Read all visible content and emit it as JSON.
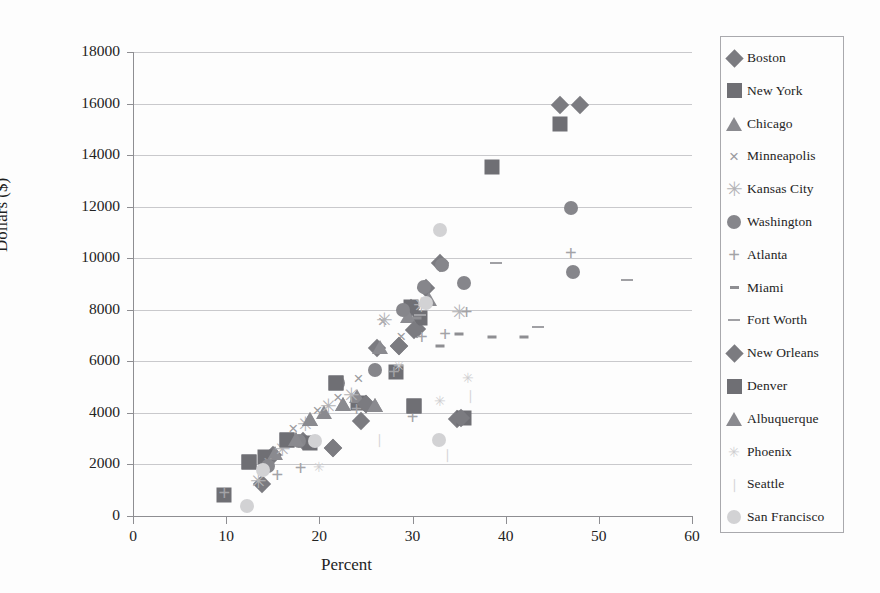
{
  "chart_data": {
    "type": "scatter",
    "title": "",
    "xlabel": "Percent",
    "ylabel": "Dollars ($)",
    "xlim": [
      0,
      60
    ],
    "ylim": [
      0,
      18000
    ],
    "xticks": [
      "0",
      "10",
      "20",
      "30",
      "40",
      "50",
      "60"
    ],
    "yticks": [
      "0",
      "2000",
      "4000",
      "6000",
      "8000",
      "10000",
      "12000",
      "14000",
      "16000",
      "18000"
    ],
    "grid": "horizontal",
    "legend_position": "right-outside",
    "series": [
      {
        "name": "Boston",
        "marker": "diamond",
        "color": "#7b7b80",
        "points": [
          [
            45.8,
            15950
          ],
          [
            48.0,
            15950
          ],
          [
            33.0,
            9800
          ],
          [
            31.5,
            8850
          ],
          [
            29.8,
            8050
          ],
          [
            30.5,
            7250
          ],
          [
            28.5,
            6600
          ],
          [
            26.2,
            6500
          ],
          [
            25.0,
            4350
          ],
          [
            24.5,
            3700
          ],
          [
            21.5,
            2650
          ],
          [
            18.2,
            2900
          ],
          [
            15.0,
            2350
          ],
          [
            13.8,
            1250
          ],
          [
            34.8,
            3750
          ]
        ]
      },
      {
        "name": "New York",
        "marker": "square",
        "color": "#6f6f74",
        "points": [
          [
            45.8,
            15200
          ],
          [
            38.5,
            13550
          ],
          [
            29.8,
            8100
          ],
          [
            30.8,
            7700
          ],
          [
            28.2,
            5600
          ],
          [
            21.8,
            5150
          ],
          [
            24.2,
            4400
          ],
          [
            19.0,
            2850
          ],
          [
            16.5,
            2950
          ],
          [
            14.2,
            2300
          ],
          [
            12.5,
            2100
          ],
          [
            9.8,
            800
          ],
          [
            30.2,
            4280
          ],
          [
            35.5,
            3800
          ]
        ]
      },
      {
        "name": "Chicago",
        "marker": "triangle",
        "color": "#8a8a8f",
        "points": [
          [
            31.8,
            8400
          ],
          [
            29.5,
            7750
          ],
          [
            26.5,
            6550
          ],
          [
            24.0,
            4650
          ],
          [
            22.5,
            4350
          ],
          [
            20.5,
            4050
          ],
          [
            19.0,
            3750
          ],
          [
            17.5,
            3000
          ],
          [
            15.2,
            2450
          ],
          [
            26.0,
            4300
          ]
        ]
      },
      {
        "name": "Minneapolis",
        "marker": "x",
        "color": "#9b9b9f",
        "points": [
          [
            29.0,
            7950
          ],
          [
            26.8,
            7550
          ],
          [
            24.2,
            5350
          ],
          [
            22.0,
            4600
          ],
          [
            19.8,
            4100
          ],
          [
            17.2,
            3400
          ],
          [
            14.5,
            2150
          ],
          [
            28.8,
            7000
          ]
        ]
      },
      {
        "name": "Kansas City",
        "marker": "star",
        "color": "#b4b4b7",
        "points": [
          [
            35.0,
            7900
          ],
          [
            31.0,
            8200
          ],
          [
            27.0,
            7600
          ],
          [
            23.5,
            4700
          ],
          [
            21.0,
            4250
          ],
          [
            18.5,
            3550
          ],
          [
            16.0,
            2600
          ],
          [
            13.5,
            1350
          ]
        ]
      },
      {
        "name": "Washington",
        "marker": "circle",
        "color": "#86868b",
        "points": [
          [
            47.0,
            11950
          ],
          [
            47.2,
            9450
          ],
          [
            33.2,
            9750
          ],
          [
            31.2,
            8900
          ],
          [
            35.5,
            9050
          ],
          [
            29.0,
            8000
          ],
          [
            22.0,
            5150
          ],
          [
            26.0,
            5650
          ],
          [
            17.8,
            2900
          ],
          [
            14.5,
            1950
          ]
        ]
      },
      {
        "name": "Atlanta",
        "marker": "plus",
        "color": "#a3a3a7",
        "points": [
          [
            47.0,
            10200
          ],
          [
            35.8,
            7900
          ],
          [
            33.5,
            7050
          ],
          [
            31.0,
            6950
          ],
          [
            28.0,
            5600
          ],
          [
            24.0,
            4150
          ],
          [
            18.0,
            1850
          ],
          [
            15.5,
            1600
          ],
          [
            9.8,
            900
          ],
          [
            30.0,
            3850
          ]
        ]
      },
      {
        "name": "Miami",
        "marker": "dash",
        "color": "#8e8e92",
        "points": [
          [
            42.0,
            6950
          ],
          [
            38.5,
            6950
          ],
          [
            35.0,
            7050
          ],
          [
            33.0,
            6600
          ],
          [
            30.5,
            7700
          ]
        ]
      },
      {
        "name": "Fort Worth",
        "marker": "dash-long",
        "color": "#a0a0a4",
        "points": [
          [
            53.0,
            9150
          ],
          [
            43.5,
            7350
          ],
          [
            39.0,
            9800
          ],
          [
            30.8,
            7800
          ]
        ]
      },
      {
        "name": "New Orleans",
        "marker": "diamond",
        "color": "#7b7b80",
        "points": [
          [
            35.2,
            3800
          ],
          [
            30.2,
            7200
          ],
          [
            28.5,
            6600
          ],
          [
            25.0,
            4350
          ],
          [
            21.5,
            2650
          ]
        ]
      },
      {
        "name": "Denver",
        "marker": "square",
        "color": "#6f6f74",
        "points": [
          [
            30.2,
            4280
          ],
          [
            21.8,
            5150
          ],
          [
            16.5,
            2950
          ],
          [
            12.5,
            2100
          ]
        ]
      },
      {
        "name": "Albuquerque",
        "marker": "triangle",
        "color": "#8a8a8f",
        "points": [
          [
            26.0,
            4300
          ],
          [
            22.5,
            4350
          ],
          [
            19.0,
            3750
          ],
          [
            17.5,
            3000
          ]
        ]
      },
      {
        "name": "Phoenix",
        "marker": "star-small",
        "color": "#cfcfd1",
        "points": [
          [
            36.0,
            5350
          ],
          [
            33.0,
            4450
          ],
          [
            28.5,
            5800
          ],
          [
            20.0,
            1900
          ]
        ]
      },
      {
        "name": "Seattle",
        "marker": "dot-small",
        "color": "#d6d6d8",
        "points": [
          [
            36.2,
            4700
          ],
          [
            33.8,
            2400
          ],
          [
            26.5,
            3000
          ]
        ]
      },
      {
        "name": "San Francisco",
        "marker": "circle-light",
        "color": "#d2d2d4",
        "points": [
          [
            33.0,
            11100
          ],
          [
            32.8,
            2950
          ],
          [
            19.5,
            2900
          ],
          [
            14.0,
            1800
          ],
          [
            12.2,
            400
          ],
          [
            31.5,
            8250
          ]
        ]
      }
    ]
  },
  "legend": {
    "items": [
      {
        "label": "Boston",
        "marker": "diamond"
      },
      {
        "label": "New York",
        "marker": "square"
      },
      {
        "label": "Chicago",
        "marker": "triangle"
      },
      {
        "label": "Minneapolis",
        "marker": "x"
      },
      {
        "label": "Kansas City",
        "marker": "star"
      },
      {
        "label": "Washington",
        "marker": "circle"
      },
      {
        "label": "Atlanta",
        "marker": "plus"
      },
      {
        "label": "Miami",
        "marker": "dash"
      },
      {
        "label": "Fort Worth",
        "marker": "dash-long"
      },
      {
        "label": "New Orleans",
        "marker": "diamond"
      },
      {
        "label": "Denver",
        "marker": "square"
      },
      {
        "label": "Albuquerque",
        "marker": "triangle"
      },
      {
        "label": "Phoenix",
        "marker": "star-small"
      },
      {
        "label": "Seattle",
        "marker": "dot-small"
      },
      {
        "label": "San Francisco",
        "marker": "circle-light"
      }
    ]
  }
}
